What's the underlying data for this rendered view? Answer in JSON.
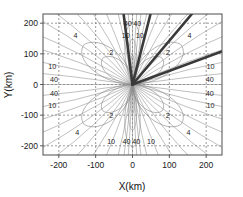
{
  "figure": {
    "background": "#ffffff",
    "frame_color": "#4d4d4d",
    "grid_color": "#6e6e6e",
    "contour_color": "#8c8c8c",
    "beam_color": "#3a3a3a"
  },
  "chart_data": {
    "type": "line",
    "title": "",
    "subtitle": "",
    "xlabel": "X(km)",
    "ylabel": "Y(km)",
    "xlim": [
      -243,
      243
    ],
    "ylim": [
      -230,
      230
    ],
    "xticks": [
      -200,
      -100,
      0,
      100,
      200
    ],
    "xticklabels": [
      "-200",
      "-100",
      "0",
      "100",
      "200"
    ],
    "yticks": [
      -200,
      -100,
      0,
      100,
      200
    ],
    "yticklabels": [
      "-200",
      "-100",
      "0",
      "100",
      "200"
    ],
    "grid": true,
    "grid_style": "dashed",
    "legend": "none",
    "legend_position": "none",
    "contour_levels": [
      2,
      4,
      10,
      40
    ],
    "contour_label_values": [
      "2",
      "4",
      "10",
      "40"
    ],
    "annotations": [
      {
        "text": "4",
        "x": -155,
        "y": 160
      },
      {
        "text": "2",
        "x": -58,
        "y": 103
      },
      {
        "text": "40",
        "x": -13,
        "y": 198
      },
      {
        "text": "40",
        "x": 13,
        "y": 198
      },
      {
        "text": "10",
        "x": -18,
        "y": 160
      },
      {
        "text": "10",
        "x": 20,
        "y": 160
      },
      {
        "text": "4",
        "x": 155,
        "y": 160
      },
      {
        "text": "2",
        "x": 96,
        "y": 103
      },
      {
        "text": "10",
        "x": -218,
        "y": 60
      },
      {
        "text": "40",
        "x": -213,
        "y": 16
      },
      {
        "text": "40",
        "x": -213,
        "y": -28
      },
      {
        "text": "10",
        "x": -218,
        "y": -68
      },
      {
        "text": "10",
        "x": 212,
        "y": 60
      },
      {
        "text": "40",
        "x": 210,
        "y": 16
      },
      {
        "text": "40",
        "x": 210,
        "y": -28
      },
      {
        "text": "10",
        "x": 212,
        "y": -68
      },
      {
        "text": "2",
        "x": -58,
        "y": -100
      },
      {
        "text": "4",
        "x": -150,
        "y": -155
      },
      {
        "text": "2",
        "x": 96,
        "y": -100
      },
      {
        "text": "4",
        "x": 152,
        "y": -155
      },
      {
        "text": "10",
        "x": -58,
        "y": -187
      },
      {
        "text": "40",
        "x": -16,
        "y": -187
      },
      {
        "text": "40",
        "x": 10,
        "y": -187
      },
      {
        "text": "10",
        "x": 50,
        "y": -187
      }
    ],
    "petals": [
      {
        "angle_deg": 135,
        "label": "4"
      },
      {
        "angle_deg": 90,
        "label": "4"
      },
      {
        "angle_deg": 45,
        "label": "4"
      },
      {
        "angle_deg": 225,
        "label": "4"
      },
      {
        "angle_deg": 270,
        "label": "4"
      },
      {
        "angle_deg": 315,
        "label": "4"
      }
    ],
    "beams": [
      {
        "angle_deg": 96,
        "length": 260,
        "width": 2.6
      },
      {
        "angle_deg": 78,
        "length": 260,
        "width": 2.6
      },
      {
        "angle_deg": 55,
        "length": 300,
        "width": 2.6
      },
      {
        "angle_deg": 24,
        "length": 320,
        "width": 2.6
      }
    ],
    "radial_fan_angles": [
      0,
      8,
      16,
      24,
      32,
      40,
      48,
      56,
      64,
      72,
      80,
      84,
      87,
      90,
      93,
      96,
      100,
      108,
      116,
      124,
      132,
      140,
      148,
      156,
      164,
      172,
      180,
      188,
      196,
      204,
      212,
      220,
      228,
      236,
      244,
      252,
      260,
      264,
      267,
      270,
      273,
      276,
      280,
      288,
      296,
      304,
      312,
      320,
      328,
      336,
      344,
      352
    ]
  }
}
